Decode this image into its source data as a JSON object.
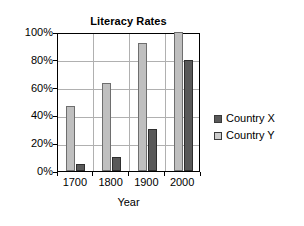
{
  "chart_data": {
    "type": "bar",
    "title": "Literacy Rates",
    "xlabel": "Year",
    "ylabel": "",
    "categories": [
      "1700",
      "1800",
      "1900",
      "2000"
    ],
    "series": [
      {
        "name": "Country X",
        "values": [
          5,
          10,
          30,
          80
        ],
        "color": "#595959"
      },
      {
        "name": "Country Y",
        "values": [
          47,
          63,
          92,
          100
        ],
        "color": "#bfbfbf"
      }
    ],
    "series_draw_order": [
      "Country Y",
      "Country X"
    ],
    "ylim": [
      0,
      100
    ],
    "ytick_values": [
      0,
      20,
      40,
      60,
      80,
      100
    ],
    "ytick_labels": [
      "0%",
      "20%",
      "40%",
      "60%",
      "80%",
      "100%"
    ],
    "grid": "horizontal-and-vertical",
    "legend_position": "right"
  },
  "legend": {
    "items": [
      {
        "label": "Country X"
      },
      {
        "label": "Country Y"
      }
    ]
  }
}
